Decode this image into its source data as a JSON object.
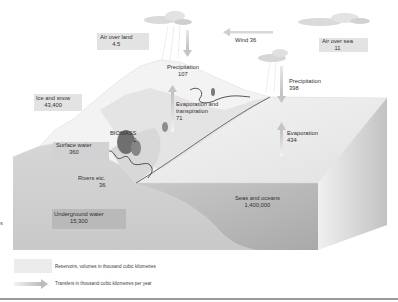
{
  "diagram": {
    "reservoirs": [
      {
        "id": "air_over_land",
        "label": "Air over land",
        "value": "4.5"
      },
      {
        "id": "air_over_sea",
        "label": "Air over sea",
        "value": "11"
      },
      {
        "id": "ice_and_snow",
        "label": "Ice and snow",
        "value": "43,400"
      },
      {
        "id": "biomass",
        "label": "BIOMASS",
        "value": "2"
      },
      {
        "id": "surface_water",
        "label": "Surface water",
        "value": "360"
      },
      {
        "id": "underground_water",
        "label": "Underground water",
        "value": "15,300"
      },
      {
        "id": "seas_and_oceans",
        "label": "Seas and oceans",
        "value": "1,400,000"
      }
    ],
    "transfers": [
      {
        "id": "precipitation_land",
        "label": "Precipitation",
        "value": "107"
      },
      {
        "id": "evapotranspiration",
        "label": "Evaporation and transpiration",
        "label_line1": "Evaporation and",
        "label_line2": "transpiration",
        "value": "71"
      },
      {
        "id": "wind",
        "label": "Wind 36",
        "value": "36"
      },
      {
        "id": "precipitation_sea",
        "label": "Precipitation",
        "value": "398"
      },
      {
        "id": "evaporation_sea",
        "label": "Evaporation",
        "value": "434"
      },
      {
        "id": "rivers",
        "label": "Rivers etc.",
        "value": "36"
      }
    ],
    "legend": {
      "reservoirs": "Reservoirs, volumes in thousand cubic kilometres",
      "transfers": "Transfers in thousand cubic kilometres per year"
    },
    "edge_fragment": "s",
    "colors": {
      "background": "#ffffff",
      "label_box": "#e4e4e4",
      "sea_top": "#e9e9e9",
      "sea_front": "#bdbdbd",
      "sea_side": "#d2d2d2",
      "land": "#cfcfcf",
      "mountain": "#f2f2f2",
      "arrow": "#c8c8c8",
      "river": "#2b2b2b",
      "text": "#303030"
    }
  }
}
